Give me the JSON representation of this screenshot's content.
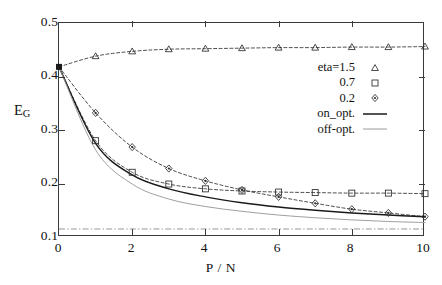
{
  "chart_data": {
    "type": "line",
    "title": "",
    "xlabel": "P / N",
    "ylabel": "E_G",
    "ylabel_base": "E",
    "ylabel_sub": "G",
    "xlim": [
      0,
      10
    ],
    "ylim": [
      0.1,
      0.5
    ],
    "xticks": [
      0,
      2,
      4,
      6,
      8,
      10
    ],
    "xticklabels": [
      "0",
      "2",
      "4",
      "6",
      "8",
      "10"
    ],
    "yticks": [
      0.1,
      0.2,
      0.3,
      0.4,
      0.5
    ],
    "yticklabels": [
      "0.1",
      "0.2",
      "0.3",
      "0.4",
      "0.5"
    ],
    "grid": false,
    "legend_position": "center-right",
    "x": [
      0,
      1,
      2,
      3,
      4,
      5,
      6,
      7,
      8,
      9,
      10
    ],
    "series": [
      {
        "name": "eta=1.5",
        "label": "eta=1.5",
        "marker": "triangle",
        "linestyle": "dashed",
        "color": "#2b2b2b",
        "values": [
          0.418,
          0.438,
          0.447,
          0.451,
          0.452,
          0.453,
          0.454,
          0.454,
          0.455,
          0.455,
          0.456
        ]
      },
      {
        "name": "eta=0.7",
        "label": "0.7",
        "marker": "square",
        "linestyle": "dashed",
        "color": "#2b2b2b",
        "values": [
          0.418,
          0.28,
          0.221,
          0.199,
          0.19,
          0.186,
          0.184,
          0.183,
          0.182,
          0.182,
          0.181
        ]
      },
      {
        "name": "eta=0.2",
        "label": "0.2",
        "marker": "diamond",
        "linestyle": "dashed",
        "color": "#2b2b2b",
        "values": [
          0.418,
          0.332,
          0.268,
          0.228,
          0.205,
          0.188,
          0.175,
          0.163,
          0.152,
          0.145,
          0.138
        ]
      },
      {
        "name": "on_opt.",
        "label": "on_opt.",
        "marker": "none",
        "linestyle": "solid",
        "color": "#1a1a1a",
        "values": [
          0.418,
          0.275,
          0.216,
          0.19,
          0.175,
          0.164,
          0.156,
          0.15,
          0.145,
          0.141,
          0.138
        ]
      },
      {
        "name": "off-opt.",
        "label": "off-opt.",
        "marker": "none",
        "linestyle": "thin",
        "color": "#9a9a9a",
        "values": [
          0.418,
          0.263,
          0.199,
          0.171,
          0.157,
          0.148,
          0.141,
          0.136,
          0.132,
          0.129,
          0.127
        ]
      }
    ],
    "asymptote_line": {
      "name": "asymptote",
      "value": 0.115,
      "linestyle": "dashdot",
      "color": "#8c8c8c"
    },
    "origin_marker": {
      "name": "origin-point",
      "x": 0,
      "y": 0.418,
      "marker": "filled-square",
      "color": "#1a1a1a"
    }
  }
}
